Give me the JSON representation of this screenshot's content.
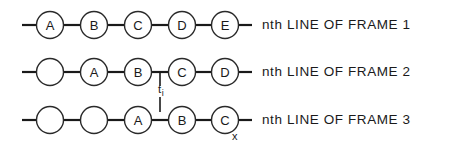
{
  "figure": {
    "type": "diagram",
    "background_color": "#ffffff",
    "line_color": "#1a1a1a",
    "circle_fill": "#ffffff",
    "circle_stroke": "#2a2a2a",
    "geometry": {
      "circle_radius": 13.5,
      "node_spacing": 44,
      "first_node_center_x": 50,
      "row_center_y": [
        25,
        72,
        120
      ],
      "wire_start_x": 22,
      "wire_end_x": 248
    },
    "rows": [
      {
        "id": "frame-1",
        "caption": "nth LINE OF FRAME 1",
        "nodes": [
          {
            "index": 0,
            "label": "A"
          },
          {
            "index": 1,
            "label": "B"
          },
          {
            "index": 2,
            "label": "C"
          },
          {
            "index": 3,
            "label": "D"
          },
          {
            "index": 4,
            "label": "E"
          }
        ]
      },
      {
        "id": "frame-2",
        "caption": "nth LINE OF FRAME 2",
        "nodes": [
          {
            "index": 0,
            "label": ""
          },
          {
            "index": 1,
            "label": "A"
          },
          {
            "index": 2,
            "label": "B"
          },
          {
            "index": 3,
            "label": "C"
          },
          {
            "index": 4,
            "label": "D"
          }
        ]
      },
      {
        "id": "frame-3",
        "caption": "nth LINE OF FRAME 3",
        "nodes": [
          {
            "index": 0,
            "label": ""
          },
          {
            "index": 1,
            "label": ""
          },
          {
            "index": 2,
            "label": "A"
          },
          {
            "index": 3,
            "label": "B"
          },
          {
            "index": 4,
            "label": "C"
          }
        ]
      }
    ],
    "annotations": {
      "time_marker": {
        "base": "t",
        "subscript": "i",
        "tick_x": 160,
        "tick_top_y": 72,
        "tick_bottom_y": 112
      },
      "axis_marker": {
        "label": "x",
        "x": 232,
        "y": 131
      }
    }
  }
}
